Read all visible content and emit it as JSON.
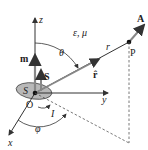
{
  "diagram": {
    "axes": {
      "x": "x",
      "y": "y",
      "z": "z"
    },
    "origin": "O",
    "medium": "ε, μ",
    "angles": {
      "polar": "θ",
      "azimuth": "φ"
    },
    "vectors": {
      "magnetic_moment": "m",
      "surface_vector": "S",
      "unit_radial": "r̂",
      "potential": "A"
    },
    "loop": {
      "surface": "S",
      "current": "I"
    },
    "distance": "r",
    "point": "P",
    "colors": {
      "loop_fill": "#b8b8b8",
      "lines": "#333333",
      "dashed": "#555555"
    }
  }
}
